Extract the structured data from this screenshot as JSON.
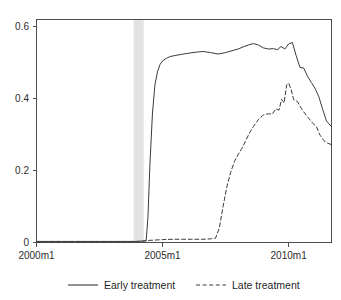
{
  "chart_data": {
    "type": "line",
    "title": "",
    "subtitle": "",
    "xlabel": "",
    "ylabel": "",
    "xlim": [
      2000.0,
      2011.7
    ],
    "ylim": [
      0,
      0.62
    ],
    "grid": false,
    "legend_position": "bottom",
    "x_tick_labels": [
      "2000m1",
      "2005m1",
      "2010m1"
    ],
    "x_tick_values": [
      2000,
      2005,
      2010
    ],
    "y_tick_labels": [
      "0",
      "0.2",
      "0.4",
      "0.6"
    ],
    "y_tick_values": [
      0,
      0.2,
      0.4,
      0.6
    ],
    "annotations": [
      {
        "name": "shaded-period-band",
        "type": "vertical-band",
        "x_start": 2003.85,
        "x_end": 2004.25,
        "color": "#e2e2e2"
      }
    ],
    "series": [
      {
        "name": "Early treatment",
        "style": "solid",
        "color": "#3a3a3a",
        "x": [
          2000.0,
          2000.5,
          2001.0,
          2001.5,
          2002.0,
          2002.5,
          2003.0,
          2003.5,
          2003.9,
          2004.2,
          2004.35,
          2004.42,
          2004.5,
          2004.6,
          2004.7,
          2004.8,
          2004.9,
          2005.0,
          2005.15,
          2005.3,
          2005.5,
          2005.75,
          2006.0,
          2006.3,
          2006.6,
          2006.9,
          2007.2,
          2007.5,
          2007.8,
          2008.0,
          2008.2,
          2008.4,
          2008.6,
          2008.8,
          2009.0,
          2009.2,
          2009.4,
          2009.55,
          2009.7,
          2009.85,
          2010.0,
          2010.15,
          2010.3,
          2010.45,
          2010.6,
          2010.75,
          2010.9,
          2011.05,
          2011.2,
          2011.35,
          2011.5,
          2011.7
        ],
        "y": [
          0.003,
          0.003,
          0.003,
          0.003,
          0.003,
          0.003,
          0.003,
          0.003,
          0.003,
          0.004,
          0.005,
          0.07,
          0.22,
          0.36,
          0.44,
          0.475,
          0.495,
          0.505,
          0.512,
          0.517,
          0.52,
          0.523,
          0.526,
          0.529,
          0.531,
          0.528,
          0.524,
          0.528,
          0.534,
          0.538,
          0.544,
          0.549,
          0.553,
          0.549,
          0.541,
          0.538,
          0.539,
          0.536,
          0.545,
          0.538,
          0.552,
          0.556,
          0.519,
          0.487,
          0.485,
          0.462,
          0.445,
          0.428,
          0.405,
          0.37,
          0.338,
          0.322
        ]
      },
      {
        "name": "Late treatment",
        "style": "dashed",
        "color": "#3a3a3a",
        "x": [
          2000.0,
          2000.5,
          2001.0,
          2001.5,
          2002.0,
          2002.5,
          2003.0,
          2003.5,
          2004.0,
          2004.5,
          2005.0,
          2005.4,
          2005.8,
          2006.2,
          2006.6,
          2006.9,
          2007.1,
          2007.25,
          2007.4,
          2007.55,
          2007.7,
          2007.85,
          2008.0,
          2008.15,
          2008.3,
          2008.45,
          2008.6,
          2008.8,
          2009.0,
          2009.2,
          2009.35,
          2009.5,
          2009.62,
          2009.72,
          2009.82,
          2009.92,
          2010.0,
          2010.1,
          2010.2,
          2010.35,
          2010.5,
          2010.65,
          2010.8,
          2010.95,
          2011.1,
          2011.25,
          2011.4,
          2011.55,
          2011.7
        ],
        "y": [
          0.002,
          0.002,
          0.002,
          0.002,
          0.002,
          0.002,
          0.002,
          0.002,
          0.002,
          0.006,
          0.008,
          0.009,
          0.009,
          0.009,
          0.009,
          0.01,
          0.012,
          0.04,
          0.1,
          0.155,
          0.195,
          0.225,
          0.245,
          0.262,
          0.283,
          0.305,
          0.322,
          0.342,
          0.355,
          0.358,
          0.357,
          0.372,
          0.368,
          0.398,
          0.388,
          0.438,
          0.443,
          0.425,
          0.397,
          0.392,
          0.373,
          0.358,
          0.345,
          0.332,
          0.322,
          0.298,
          0.283,
          0.276,
          0.272
        ]
      }
    ]
  },
  "legend": {
    "entries": [
      {
        "label": "Early treatment",
        "style": "solid"
      },
      {
        "label": "Late treatment",
        "style": "dashed"
      }
    ]
  }
}
